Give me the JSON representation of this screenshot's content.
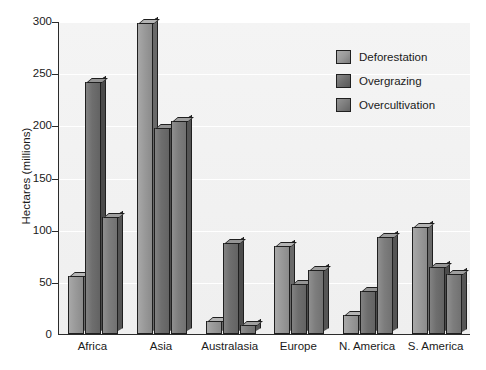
{
  "chart_data": {
    "type": "bar",
    "title": "",
    "xlabel": "",
    "ylabel": "Hectares (millions)",
    "ylim": [
      0,
      300
    ],
    "yticks": [
      "0",
      "50",
      "100",
      "150",
      "200",
      "250",
      "300"
    ],
    "grid": true,
    "legend_position": "top-right",
    "categories": [
      "Africa",
      "Asia",
      "Australasia",
      "Europe",
      "N. America",
      "S. America"
    ],
    "series": [
      {
        "name": "Deforestation",
        "color": "#9a9a9a",
        "values": [
          56,
          298,
          12,
          84,
          18,
          103
        ]
      },
      {
        "name": "Overgrazing",
        "color": "#6e6e6e",
        "values": [
          242,
          197,
          87,
          48,
          41,
          64
        ]
      },
      {
        "name": "Overcultivation",
        "color": "#7d7d7d",
        "values": [
          112,
          204,
          9,
          61,
          93,
          58
        ]
      }
    ]
  },
  "legend": {
    "items": [
      {
        "label": "Deforestation"
      },
      {
        "label": "Overgrazing"
      },
      {
        "label": "Overcultivation"
      }
    ]
  },
  "axes": {
    "y_title": "Hectares (millions)"
  },
  "colors": {
    "plot_background": "#f2f2f2",
    "axis": "#2b2b2b",
    "gridline": "#ffffff",
    "text": "#1a1a1a"
  }
}
